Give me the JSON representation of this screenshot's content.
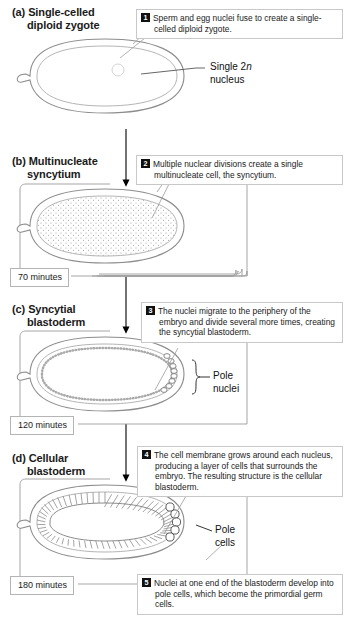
{
  "figure": {
    "stages": [
      {
        "key": "a",
        "label": "(a)",
        "title_line1": "Single-celled",
        "title_line2": "diploid zygote",
        "time": null
      },
      {
        "key": "b",
        "label": "(b)",
        "title_line1": "Multinucleate",
        "title_line2": "syncytium",
        "time": "70 minutes"
      },
      {
        "key": "c",
        "label": "(c)",
        "title_line1": "Syncytial",
        "title_line2": "blastoderm",
        "time": "120 minutes"
      },
      {
        "key": "d",
        "label": "(d)",
        "title_line1": "Cellular",
        "title_line2": "blastoderm",
        "time": "180 minutes"
      }
    ],
    "callouts": [
      {
        "number": "1",
        "text": "Sperm and egg nuclei fuse to create a single-celled diploid zygote."
      },
      {
        "number": "2",
        "text": "Multiple nuclear divisions create a single multinucleate cell, the syncytium."
      },
      {
        "number": "3",
        "text": "The nuclei migrate to the periphery of the embryo and divide several more times, creating the syncytial blastoderm."
      },
      {
        "number": "4",
        "text": "The cell membrane grows around each nucleus, producing a layer of cells that surrounds the embryo. The resulting structure is the cellular blastoderm."
      },
      {
        "number": "5",
        "text": "Nuclei at one end of the blastoderm develop into pole cells, which become the primordial germ cells."
      }
    ],
    "leader_labels": [
      {
        "key": "single_2n",
        "line1": "Single 2",
        "italic": "n",
        "line2": "nucleus"
      },
      {
        "key": "pole_nuclei",
        "line1": "Pole",
        "line2": "nuclei"
      },
      {
        "key": "pole_cells",
        "line1": "Pole",
        "line2": "cells"
      }
    ],
    "colors": {
      "badge_bg": "#111111",
      "badge_fg": "#ffffff",
      "callout_border": "#c8c8c8",
      "timebox_border": "#b4b4b4",
      "outline": "#8c8c8c",
      "leader": "#555555",
      "arrow": "#000000",
      "background": "#ffffff"
    }
  }
}
